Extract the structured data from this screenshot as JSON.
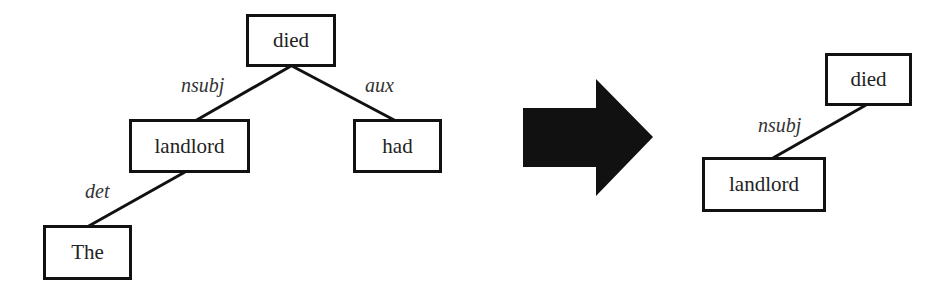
{
  "diagram": {
    "title": "",
    "before_tree": {
      "nodes": [
        {
          "id": "died",
          "label": "died"
        },
        {
          "id": "landlord",
          "label": "landlord"
        },
        {
          "id": "had",
          "label": "had"
        },
        {
          "id": "the",
          "label": "The"
        }
      ],
      "edges": [
        {
          "from": "died",
          "to": "landlord",
          "label": "nsubj"
        },
        {
          "from": "died",
          "to": "had",
          "label": "aux"
        },
        {
          "from": "landlord",
          "to": "the",
          "label": "det"
        }
      ]
    },
    "transform_arrow": {
      "direction": "right",
      "color": "#111111"
    },
    "after_tree": {
      "nodes": [
        {
          "id": "died",
          "label": "died"
        },
        {
          "id": "landlord",
          "label": "landlord"
        }
      ],
      "edges": [
        {
          "from": "died",
          "to": "landlord",
          "label": "nsubj"
        }
      ]
    }
  }
}
